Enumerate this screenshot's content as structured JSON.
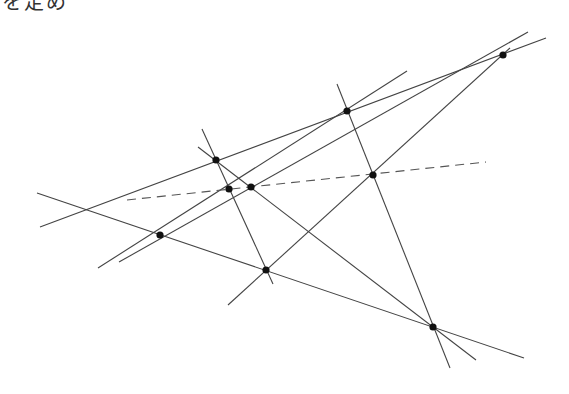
{
  "caption_fragment": "を定め",
  "diagram": {
    "type": "projective-geometry-construction",
    "stroke_color": "#444444",
    "point_color": "#111111",
    "points": [
      {
        "id": "P1",
        "x": 216,
        "y": 160
      },
      {
        "id": "P2",
        "x": 229,
        "y": 189
      },
      {
        "id": "P3",
        "x": 251,
        "y": 187
      },
      {
        "id": "P4",
        "x": 347,
        "y": 111
      },
      {
        "id": "P5",
        "x": 373,
        "y": 175
      },
      {
        "id": "P6",
        "x": 503,
        "y": 55
      },
      {
        "id": "P7",
        "x": 160,
        "y": 235
      },
      {
        "id": "P8",
        "x": 266,
        "y": 270
      },
      {
        "id": "P9",
        "x": 433,
        "y": 327
      }
    ],
    "lines": [
      {
        "id": "A",
        "x1": 37,
        "y1": 193,
        "x2": 524,
        "y2": 358,
        "style": "solid"
      },
      {
        "id": "B",
        "x1": 40,
        "y1": 227,
        "x2": 546,
        "y2": 38,
        "style": "solid"
      },
      {
        "id": "C",
        "x1": 98,
        "y1": 268,
        "x2": 407,
        "y2": 71,
        "style": "solid"
      },
      {
        "id": "D",
        "x1": 119,
        "y1": 262,
        "x2": 528,
        "y2": 32,
        "style": "solid"
      },
      {
        "id": "E",
        "x1": 228,
        "y1": 305,
        "x2": 510,
        "y2": 48,
        "style": "solid"
      },
      {
        "id": "F",
        "x1": 337,
        "y1": 84,
        "x2": 450,
        "y2": 368,
        "style": "solid"
      },
      {
        "id": "G",
        "x1": 202,
        "y1": 129,
        "x2": 273,
        "y2": 284,
        "style": "solid"
      },
      {
        "id": "H",
        "x1": 198,
        "y1": 147,
        "x2": 476,
        "y2": 360,
        "style": "solid"
      },
      {
        "id": "L",
        "x1": 127,
        "y1": 200,
        "x2": 486,
        "y2": 162,
        "style": "dashed"
      }
    ]
  }
}
